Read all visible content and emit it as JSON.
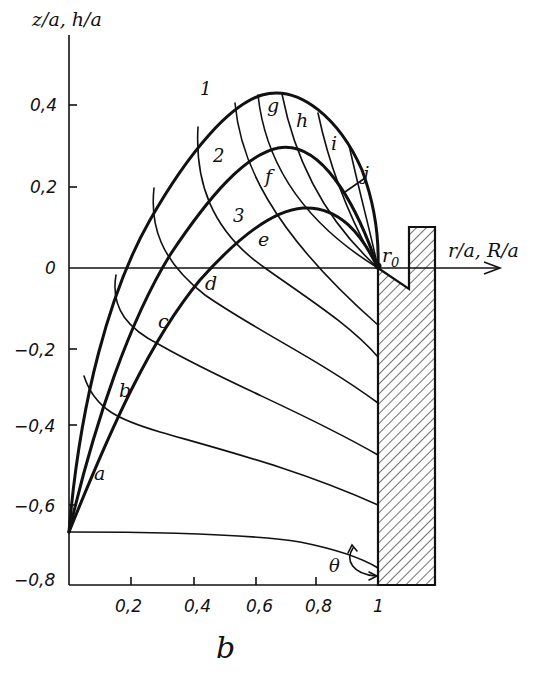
{
  "figure": {
    "y_axis_label": "z/a, h/a",
    "x_axis_label": "r/a, R/a",
    "bottom_label": "b",
    "y_ticks": [
      "0,4",
      "0,2",
      "0",
      "−0,2",
      "−0,4",
      "−0,6",
      "−0,8"
    ],
    "x_ticks": [
      "0,2",
      "0,4",
      "0,6",
      "0,8",
      "1"
    ],
    "point_label": "r0",
    "angle_label": "θ",
    "main_curves": [
      "1",
      "2",
      "3"
    ],
    "crossing_curves": [
      "a",
      "b",
      "c",
      "d",
      "e",
      "f",
      "g",
      "h",
      "i",
      "j"
    ]
  },
  "colors": {
    "ink": "#111111",
    "background": "#ffffff"
  }
}
